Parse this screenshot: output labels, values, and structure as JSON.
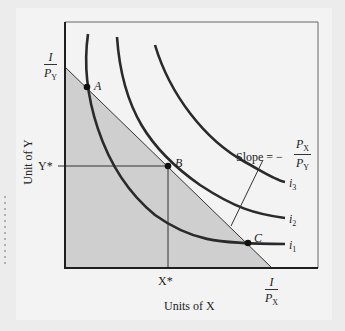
{
  "figure": {
    "y_axis_label": "Unit of Y",
    "x_axis_label": "Units of X",
    "y_intercept": {
      "numerator": "I",
      "denominator_var": "P",
      "denominator_sub": "Y"
    },
    "x_intercept": {
      "numerator": "I",
      "denominator_var": "P",
      "denominator_sub": "X"
    },
    "y_star_label": "Y*",
    "x_star_label": "X*",
    "points": [
      {
        "id": "A",
        "label": "A"
      },
      {
        "id": "B",
        "label": "B"
      },
      {
        "id": "C",
        "label": "C"
      }
    ],
    "indifference_curves": [
      {
        "label": "i",
        "sub": "1"
      },
      {
        "label": "i",
        "sub": "2"
      },
      {
        "label": "i",
        "sub": "3"
      }
    ],
    "slope_annotation": {
      "prefix": "Slope = −",
      "numerator_var": "P",
      "numerator_sub": "X",
      "denominator_var": "P",
      "denominator_sub": "Y"
    },
    "colors": {
      "background": "#f3f3f3",
      "feasible_region": "#cfcfcf",
      "curve": "#2a2a2a",
      "frame": "#1e1e1e"
    }
  }
}
